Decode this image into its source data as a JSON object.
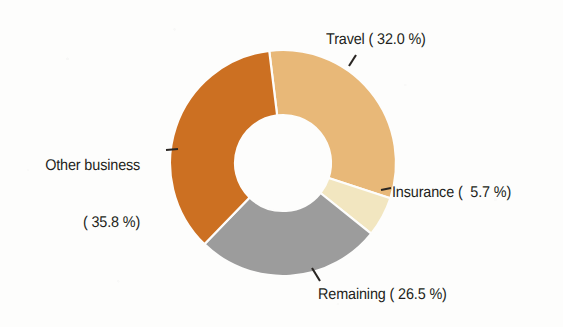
{
  "chart_data": {
    "type": "pie",
    "variant": "donut",
    "title": "",
    "subtitle": "",
    "xlabel": "",
    "ylabel": "",
    "legend_position": "none",
    "grid": false,
    "value_unit": "%",
    "total": 100.0,
    "categories": [
      "Travel",
      "Insurance",
      "Remaining",
      "Other business"
    ],
    "values": [
      32.0,
      5.7,
      26.5,
      35.8
    ],
    "slices": [
      {
        "name": "Travel",
        "value": 32.0,
        "label": "Travel ( 32.0 %)",
        "color": "#e8b878",
        "start_angle": -7.0,
        "end_angle": 108.2,
        "label_position": "top-right"
      },
      {
        "name": "Insurance",
        "value": 5.7,
        "label": "Insurance (  5.7 %)",
        "color": "#f2e6c0",
        "start_angle": 108.2,
        "end_angle": 128.7,
        "label_position": "right"
      },
      {
        "name": "Remaining",
        "value": 26.5,
        "label": "Remaining ( 26.5 %)",
        "color": "#9c9c9c",
        "start_angle": 128.7,
        "end_angle": 224.1,
        "label_position": "bottom"
      },
      {
        "name": "Other business",
        "value": 35.8,
        "label_line1": "Other business",
        "label_line2": "( 35.8 %)",
        "color": "#cc7022",
        "start_angle": 224.1,
        "end_angle": 353.0,
        "label_position": "left"
      }
    ],
    "geometry": {
      "center_x": 283,
      "center_y": 163,
      "outer_radius": 113,
      "inner_radius": 48,
      "gap_color": "#fdfdfc"
    },
    "annotations": [
      {
        "name": "travel-leader",
        "for": "Travel"
      },
      {
        "name": "insurance-leader",
        "for": "Insurance"
      },
      {
        "name": "remaining-leader",
        "for": "Remaining"
      },
      {
        "name": "other-business-leader",
        "for": "Other business"
      }
    ]
  },
  "colors": {
    "background": "#fdfdfc",
    "text": "#231f20",
    "travel": "#e8b878",
    "insurance": "#f2e6c0",
    "remaining": "#9c9c9c",
    "other_business": "#cc7022"
  }
}
